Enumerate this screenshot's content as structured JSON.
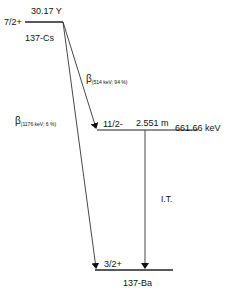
{
  "diagram": {
    "type": "nuclear-decay-scheme",
    "parent": {
      "nuclide": "137-Cs",
      "spin_parity": "7/2+",
      "half_life": "30.17 Y"
    },
    "intermediate": {
      "spin_parity": "11/2-",
      "half_life": "2.551 m",
      "energy": "661.66 keV"
    },
    "daughter": {
      "nuclide": "137-Ba",
      "spin_parity": "3/2+"
    },
    "transitions": [
      {
        "symbol": "β",
        "detail": "(514 keV; 94 %)",
        "from": "7/2+",
        "to": "11/2-"
      },
      {
        "symbol": "β",
        "detail": "(1176 keV; 6 %)",
        "from": "7/2+",
        "to": "3/2+"
      },
      {
        "symbol": "I.T.",
        "from": "11/2-",
        "to": "3/2+"
      }
    ],
    "colors": {
      "line": "#222222",
      "text": "#111111",
      "background": "#ffffff"
    }
  }
}
